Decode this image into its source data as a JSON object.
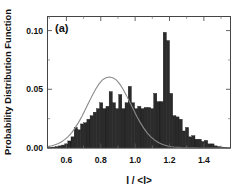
{
  "figure": {
    "panel_label": "(a)",
    "background_color": "#ffffff",
    "bar_color": "#2b2b2b",
    "curve_color": "#8a8a8a",
    "frame_color": "#444444"
  },
  "chart_data": {
    "type": "bar",
    "title": "",
    "subtitle": "",
    "xlabel": "I / <I>",
    "ylabel": "Probability Distribution Function",
    "annotations": [
      "(a)"
    ],
    "xlim": [
      0.49,
      1.555
    ],
    "ylim": [
      0.0,
      0.112
    ],
    "grid": false,
    "legend": null,
    "xticks": [
      0.6,
      0.8,
      1.0,
      1.2,
      1.4
    ],
    "xtick_labels": [
      "0.6",
      "0.8",
      "1.0",
      "1.2",
      "1.4"
    ],
    "xminor_ticks": [
      0.5,
      0.7,
      0.9,
      1.1,
      1.3,
      1.5
    ],
    "yticks": [
      0.0,
      0.05,
      0.1
    ],
    "ytick_labels": [
      "0.00",
      "0.05",
      "0.10"
    ],
    "yminor_ticks": [
      0.025,
      0.075
    ],
    "bar_width": 0.0185,
    "categories": [
      0.5065,
      0.525,
      0.5435,
      0.562,
      0.5805,
      0.599,
      0.6175,
      0.636,
      0.6545,
      0.673,
      0.6915,
      0.71,
      0.7285,
      0.747,
      0.7655,
      0.784,
      0.8025,
      0.821,
      0.8395,
      0.858,
      0.8765,
      0.895,
      0.9135,
      0.932,
      0.9505,
      0.969,
      0.9875,
      1.006,
      1.0245,
      1.043,
      1.0615,
      1.08,
      1.0985,
      1.117,
      1.1355,
      1.154,
      1.1725,
      1.191,
      1.2095,
      1.228,
      1.2465,
      1.265,
      1.2835,
      1.302,
      1.3205,
      1.339,
      1.3575,
      1.376,
      1.3945,
      1.413,
      1.4315,
      1.45,
      1.4685,
      1.487,
      1.5055,
      1.524
    ],
    "values": [
      0.0005,
      0.0008,
      0.0012,
      0.0018,
      0.0025,
      0.0035,
      0.006,
      0.0095,
      0.0175,
      0.0155,
      0.0205,
      0.0215,
      0.0245,
      0.0275,
      0.0305,
      0.0335,
      0.0385,
      0.0335,
      0.0355,
      0.048,
      0.0385,
      0.0335,
      0.0455,
      0.0335,
      0.0385,
      0.0525,
      0.0385,
      0.0335,
      0.0355,
      0.0335,
      0.0345,
      0.0345,
      0.0335,
      0.0465,
      0.0395,
      0.0395,
      0.0985,
      0.0915,
      0.0465,
      0.0275,
      0.0265,
      0.0245,
      0.0145,
      0.0175,
      0.0095,
      0.0105,
      0.0075,
      0.0075,
      0.0055,
      0.0065,
      0.0035,
      0.0035,
      0.0018,
      0.0012,
      0.0008,
      0.0005
    ],
    "fit_curve": {
      "name": "gaussian-fit",
      "type": "line",
      "peak_value": 0.0605,
      "mean": 1.0,
      "sigma": 0.145,
      "x": [
        0.49,
        0.51,
        0.53,
        0.55,
        0.57,
        0.59,
        0.61,
        0.63,
        0.65,
        0.67,
        0.69,
        0.71,
        0.73,
        0.75,
        0.77,
        0.79,
        0.81,
        0.83,
        0.85,
        0.87,
        0.89,
        0.91,
        0.93,
        0.95,
        0.97,
        0.99,
        1.01,
        1.03,
        1.05,
        1.07,
        1.09,
        1.11,
        1.13,
        1.15,
        1.17,
        1.19,
        1.21,
        1.23,
        1.25,
        1.27,
        1.29,
        1.31,
        1.33,
        1.35,
        1.37,
        1.39,
        1.41,
        1.43,
        1.45,
        1.47,
        1.49,
        1.51,
        1.53,
        1.555
      ],
      "y": [
        0.0011,
        0.0017,
        0.0025,
        0.0036,
        0.0051,
        0.0071,
        0.0097,
        0.0129,
        0.0169,
        0.0216,
        0.0269,
        0.0327,
        0.0387,
        0.0446,
        0.05,
        0.0546,
        0.058,
        0.0599,
        0.0605,
        0.0599,
        0.058,
        0.0546,
        0.05,
        0.0446,
        0.0387,
        0.0327,
        0.0269,
        0.0216,
        0.0169,
        0.0129,
        0.0097,
        0.0071,
        0.0051,
        0.0036,
        0.0025,
        0.0017,
        0.0011,
        0.0007,
        0.0005,
        0.0003,
        0.0002,
        0.0001,
        0.0001,
        0.0001,
        0.0,
        0.0,
        0.0,
        0.0,
        0.0,
        0.0,
        0.0,
        0.0,
        0.0,
        0.0
      ]
    }
  }
}
